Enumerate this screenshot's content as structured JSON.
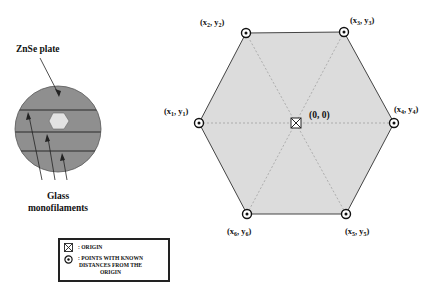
{
  "left_figure": {
    "plate_label": "ZnSe plate",
    "filament_label_line1": "Glass",
    "filament_label_line2": "monofilaments",
    "colors": {
      "plate": "#8f8f8f",
      "window": "#e2e2e2",
      "filament": "#2a2a2a"
    }
  },
  "hexagon": {
    "origin_label": "(0, 0)",
    "fill": "#dcdcdc",
    "points": [
      {
        "id": "p1",
        "label": "(x1, y1)",
        "main": "(x",
        "sub1": "1",
        "mid": ", y",
        "sub2": "1",
        "end": ")"
      },
      {
        "id": "p2",
        "label": "(x2, y2)",
        "main": "(x",
        "sub1": "2",
        "mid": ", y",
        "sub2": "2",
        "end": ")"
      },
      {
        "id": "p3",
        "label": "(x3, y3)",
        "main": "(x",
        "sub1": "3",
        "mid": ", y",
        "sub2": "3",
        "end": ")"
      },
      {
        "id": "p4",
        "label": "(x4, y4)",
        "main": "(x",
        "sub1": "4",
        "mid": ", y",
        "sub2": "4",
        "end": ")"
      },
      {
        "id": "p5",
        "label": "(x5, y5)",
        "main": "(x",
        "sub1": "5",
        "mid": ", y",
        "sub2": "5",
        "end": ")"
      },
      {
        "id": "p6",
        "label": "(x6, y6)",
        "main": "(x",
        "sub1": "6",
        "mid": ", y",
        "sub2": "6",
        "end": ")"
      }
    ]
  },
  "legend": {
    "origin_text": ": ORIGIN",
    "points_text_line1": ": POINTS WITH KNOWN",
    "points_text_line2": "DISTANCES FROM THE",
    "points_text_line3": "ORIGIN",
    "origin_icon": "boxed-x-icon",
    "point_icon": "circled-dot-icon"
  }
}
